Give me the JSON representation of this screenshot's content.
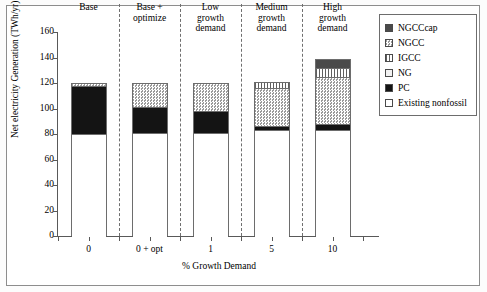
{
  "chart_data": {
    "type": "bar",
    "subtype": "stacked-bar",
    "title": "",
    "xlabel": "% Growth Demand",
    "ylabel": "Net electricity Generation (TWh/yr)",
    "ylim": [
      0,
      160
    ],
    "yticks": [
      0,
      20,
      40,
      60,
      80,
      100,
      120,
      140,
      160
    ],
    "grid": false,
    "legend_position": "right",
    "categories": [
      "0",
      "0 + opt",
      "1",
      "5",
      "10"
    ],
    "group_labels": [
      "Base",
      "Base +\noptimize",
      "Low\ngrowth\ndemand",
      "Medium\ngrowth\ndemand",
      "High\ngrowth\ndemand"
    ],
    "series": [
      {
        "name": "Existing nonfossil",
        "values": [
          80,
          81,
          81,
          83,
          83
        ]
      },
      {
        "name": "PC",
        "values": [
          38,
          20,
          17,
          3,
          5
        ]
      },
      {
        "name": "NG",
        "values": [
          0,
          0,
          0,
          0,
          0
        ]
      },
      {
        "name": "IGCC",
        "values": [
          0,
          0,
          0,
          5,
          7
        ]
      },
      {
        "name": "NGCC",
        "values": [
          2,
          19,
          22,
          30,
          37
        ]
      },
      {
        "name": "NGCCcap",
        "values": [
          0,
          0,
          0,
          0,
          7
        ]
      }
    ],
    "totals": [
      120,
      120,
      120,
      121,
      139
    ]
  },
  "axis": {
    "y_title": "Net electricity Generation (TWh/yr)",
    "x_title": "% Growth Demand",
    "y_ticks": [
      "0",
      "20",
      "40",
      "60",
      "80",
      "100",
      "120",
      "140",
      "160"
    ],
    "x_ticks": [
      "0",
      "0 + opt",
      "1",
      "5",
      "10"
    ]
  },
  "groups": [
    {
      "label": "Base"
    },
    {
      "label": "Base +\noptimize"
    },
    {
      "label": "Low\ngrowth\ndemand"
    },
    {
      "label": "Medium\ngrowth\ndemand"
    },
    {
      "label": "High\ngrowth\ndemand"
    }
  ],
  "legend": {
    "items": [
      {
        "label": "NGCCcap",
        "swatch": "ngcccap-swatch",
        "color": "#4a4a4a"
      },
      {
        "label": "NGCC",
        "swatch": "ngcc-swatch",
        "color": "#9a9a9a"
      },
      {
        "label": "IGCC",
        "swatch": "igcc-swatch",
        "color": "#f4f4f4"
      },
      {
        "label": "NG",
        "swatch": "ng-swatch",
        "color": "#f2f2f2"
      },
      {
        "label": "PC",
        "swatch": "pc-swatch",
        "color": "#141414"
      },
      {
        "label": "Existing nonfossil",
        "swatch": "existing-nonfossil-swatch",
        "color": "#ffffff"
      }
    ]
  }
}
